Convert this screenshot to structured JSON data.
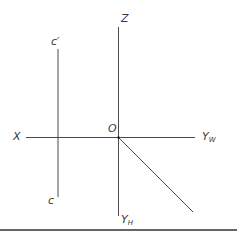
{
  "diagram": {
    "type": "three-view projection axes",
    "colors": {
      "line": "#4a4a4a",
      "label": "#3a3a3a",
      "rule": "#333333"
    },
    "labels": {
      "z_axis": "Z",
      "x_axis": "X",
      "origin": "O",
      "yw_main": "Y",
      "yw_sub": "W",
      "yh_main": "Y",
      "yh_sub": "H",
      "c_prime": "c′",
      "c": "c"
    }
  }
}
